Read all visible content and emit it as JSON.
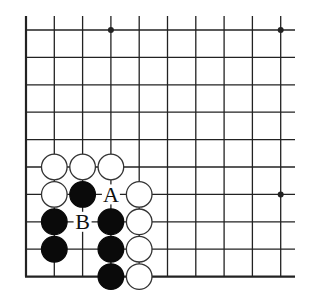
{
  "diagram": {
    "type": "go-board-fragment",
    "columns": 10,
    "rows": 10,
    "edges": [
      "left",
      "bottom"
    ],
    "colors": {
      "line": "#222222",
      "black_stone": "#0a0a0a",
      "white_stone": "#ffffff",
      "stone_outline": "#333333",
      "background": "#ffffff"
    },
    "star_points": [
      {
        "col": 3,
        "row": 0
      },
      {
        "col": 9,
        "row": 0
      },
      {
        "col": 9,
        "row": 6
      }
    ],
    "stones": [
      {
        "color": "white",
        "col": 1,
        "row": 5
      },
      {
        "color": "white",
        "col": 2,
        "row": 5
      },
      {
        "color": "white",
        "col": 3,
        "row": 5
      },
      {
        "color": "white",
        "col": 1,
        "row": 6
      },
      {
        "color": "black",
        "col": 2,
        "row": 6
      },
      {
        "color": "white",
        "col": 4,
        "row": 6
      },
      {
        "color": "black",
        "col": 1,
        "row": 7
      },
      {
        "color": "black",
        "col": 3,
        "row": 7
      },
      {
        "color": "white",
        "col": 4,
        "row": 7
      },
      {
        "color": "black",
        "col": 1,
        "row": 8
      },
      {
        "color": "black",
        "col": 3,
        "row": 8
      },
      {
        "color": "white",
        "col": 4,
        "row": 8
      },
      {
        "color": "black",
        "col": 3,
        "row": 9
      },
      {
        "color": "white",
        "col": 4,
        "row": 9
      }
    ],
    "labels": [
      {
        "text": "A",
        "col": 3,
        "row": 6
      },
      {
        "text": "B",
        "col": 2,
        "row": 7
      }
    ]
  }
}
